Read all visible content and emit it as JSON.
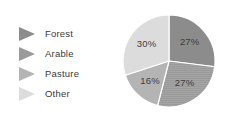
{
  "legend": {
    "items": [
      {
        "label": "Forest",
        "marker": "triangle-right-icon",
        "color": "#8c8c8c"
      },
      {
        "label": "Arable",
        "marker": "triangle-right-icon",
        "color": "#9a9a9a"
      },
      {
        "label": "Pasture",
        "marker": "triangle-right-icon",
        "color": "#b4b4b4"
      },
      {
        "label": "Other",
        "marker": "triangle-right-icon",
        "color": "#dcdcdc"
      }
    ]
  },
  "chart_data": {
    "type": "pie",
    "title": "",
    "categories": [
      "Forest",
      "Arable",
      "Pasture",
      "Other"
    ],
    "values": [
      27,
      27,
      16,
      30
    ],
    "labels": [
      "27%",
      "27%",
      "16%",
      "30%"
    ],
    "colors": [
      "#8c8c8c",
      "#9a9a9a",
      "#b4b4b4",
      "#dcdcdc"
    ],
    "units": "percent",
    "total": 100,
    "start_angle_deg": 0,
    "direction": "clockwise",
    "legend_position": "left",
    "grid": false,
    "slices": [
      {
        "category": "Forest",
        "value": 27,
        "label": "27%",
        "color": "#8c8c8c",
        "position": "top-right"
      },
      {
        "category": "Arable",
        "value": 27,
        "label": "27%",
        "color": "#9a9a9a",
        "position": "bottom-right"
      },
      {
        "category": "Pasture",
        "value": 16,
        "label": "16%",
        "color": "#b4b4b4",
        "position": "bottom-left"
      },
      {
        "category": "Other",
        "value": 30,
        "label": "30%",
        "color": "#dcdcdc",
        "position": "top-left"
      }
    ]
  }
}
